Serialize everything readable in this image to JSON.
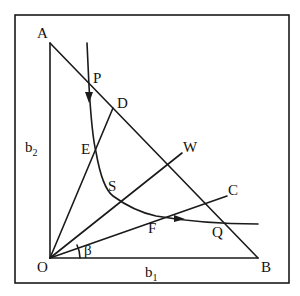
{
  "diagram": {
    "points": {
      "A": "A",
      "P": "P",
      "D": "D",
      "E": "E",
      "W": "W",
      "S": "S",
      "C": "C",
      "F": "F",
      "Q": "Q",
      "O": "O",
      "B": "B"
    },
    "axis_labels": {
      "vertical": "b",
      "vertical_sub": "2",
      "horizontal": "b",
      "horizontal_sub": "1"
    },
    "angle_label": "β"
  }
}
